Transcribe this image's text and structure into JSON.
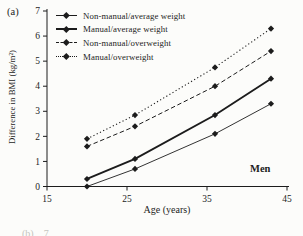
{
  "panel": {
    "label": "(a)"
  },
  "annotations": {
    "group_label": "Men",
    "next_panel_fragment": "(b)    7"
  },
  "colors": {
    "ink": "#1c1c1c",
    "background": "#fcfcfa",
    "faded": "#c5c5c0"
  },
  "chart_data": {
    "type": "line",
    "title": "",
    "xlabel": "Age (years)",
    "ylabel": "Difference in BMI (kg/m²)",
    "x": [
      20,
      26,
      36,
      43
    ],
    "xlim": [
      15,
      45
    ],
    "ylim": [
      0,
      7
    ],
    "xticks": [
      15,
      25,
      35,
      45
    ],
    "yticks": [
      0,
      1,
      2,
      3,
      4,
      5,
      6,
      7
    ],
    "grid": false,
    "legend_position": "top-left",
    "marker": "diamond",
    "series": [
      {
        "name": "Non-manual/average weight",
        "style": "solid-thin",
        "color": "#1c1c1c",
        "values": [
          0.0,
          0.7,
          2.1,
          3.3
        ]
      },
      {
        "name": "Manual/average weight",
        "style": "solid-thick",
        "color": "#1c1c1c",
        "values": [
          0.3,
          1.1,
          2.85,
          4.3
        ]
      },
      {
        "name": "Non-manual/overweight",
        "style": "dashed",
        "color": "#1c1c1c",
        "values": [
          1.6,
          2.4,
          4.0,
          5.4
        ]
      },
      {
        "name": "Manual/overweight",
        "style": "dotted",
        "color": "#1c1c1c",
        "values": [
          1.9,
          2.85,
          4.75,
          6.3
        ]
      }
    ]
  }
}
